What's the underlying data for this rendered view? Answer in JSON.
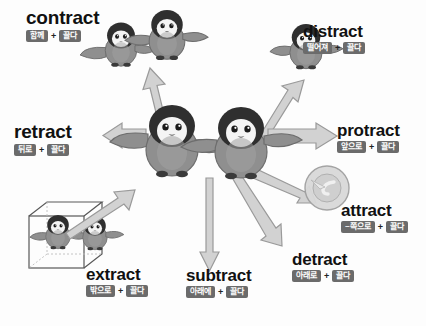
{
  "diagram": {
    "root_meaning": "끌다",
    "plus_symbol": "+",
    "colors": {
      "background": "#fdfdfd",
      "chip_bg": "#6b6b6b",
      "chip_text": "#ffffff",
      "word_text": "#111111",
      "arrow_fill": "#cfcfcf",
      "arrow_stroke": "#9a9a9a",
      "penguin_body": "#8f8f8f",
      "penguin_head": "#2f2f2f",
      "penguin_belly": "#f2f2f2",
      "box_stroke": "#555555"
    },
    "words": [
      {
        "id": "contract",
        "word": "contract",
        "prefix": "함께",
        "root": "끌다",
        "direction": "up-left",
        "illustration": "two-penguins-together"
      },
      {
        "id": "distract",
        "word": "distract",
        "prefix": "떨어져",
        "root": "끌다",
        "direction": "up-right",
        "illustration": "single-penguin-away"
      },
      {
        "id": "retract",
        "word": "retract",
        "prefix": "뒤로",
        "root": "끌다",
        "direction": "left",
        "illustration": "arrow-left"
      },
      {
        "id": "protract",
        "word": "protract",
        "prefix": "앞으로",
        "root": "끌다",
        "direction": "right",
        "illustration": "arrow-right"
      },
      {
        "id": "attract",
        "word": "attract",
        "prefix": "~쪽으로",
        "root": "끌다",
        "direction": "down-right-target",
        "illustration": "magnet-circle-target"
      },
      {
        "id": "detract",
        "word": "detract",
        "prefix": "아래로",
        "root": "끌다",
        "direction": "down-right",
        "illustration": "arrow-down-right"
      },
      {
        "id": "subtract",
        "word": "subtract",
        "prefix": "아래에",
        "root": "끌다",
        "direction": "down",
        "illustration": "arrow-down"
      },
      {
        "id": "extract",
        "word": "extract",
        "prefix": "밖으로",
        "root": "끌다",
        "direction": "down-left",
        "illustration": "penguins-in-wireframe-box"
      }
    ]
  }
}
